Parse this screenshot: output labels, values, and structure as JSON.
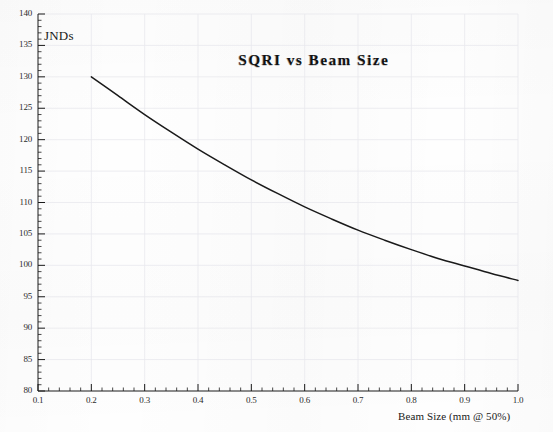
{
  "chart_data": {
    "type": "line",
    "title": "SQRI vs Beam Size",
    "xlabel": "Beam Size (mm @ 50%)",
    "ylabel": "JNDs",
    "xlim": [
      0.1,
      1.0
    ],
    "ylim": [
      80,
      140
    ],
    "grid": true,
    "legend": null,
    "x_major_step": 0.1,
    "x_minor_step": 0.02,
    "y_major_step": 5,
    "y_minor_step": 1,
    "xticks": [
      "0.1",
      "0.2",
      "0.3",
      "0.4",
      "0.5",
      "0.6",
      "0.7",
      "0.8",
      "0.9",
      "1.0"
    ],
    "xtick_values": [
      0.1,
      0.2,
      0.3,
      0.4,
      0.5,
      0.6,
      0.7,
      0.8,
      0.9,
      1.0
    ],
    "yticks": [
      "80",
      "85",
      "90",
      "95",
      "100",
      "105",
      "110",
      "115",
      "120",
      "125",
      "130",
      "135",
      "140"
    ],
    "ytick_values": [
      80,
      85,
      90,
      95,
      100,
      105,
      110,
      115,
      120,
      125,
      130,
      135,
      140
    ],
    "series": [
      {
        "name": "SQRI",
        "color": "#1a1a1a",
        "x": [
          0.2,
          0.25,
          0.3,
          0.35,
          0.4,
          0.45,
          0.5,
          0.55,
          0.6,
          0.65,
          0.7,
          0.75,
          0.8,
          0.85,
          0.9,
          0.95,
          1.0
        ],
        "values": [
          130.0,
          127.0,
          124.0,
          121.2,
          118.5,
          116.0,
          113.6,
          111.4,
          109.3,
          107.4,
          105.6,
          104.0,
          102.5,
          101.1,
          99.9,
          98.7,
          97.6
        ]
      }
    ]
  },
  "figure": {
    "background_color": "#fefefe",
    "axis_color": "#1a1a1a",
    "grid_color": "#e8e8ee",
    "title_color": "#111111"
  }
}
